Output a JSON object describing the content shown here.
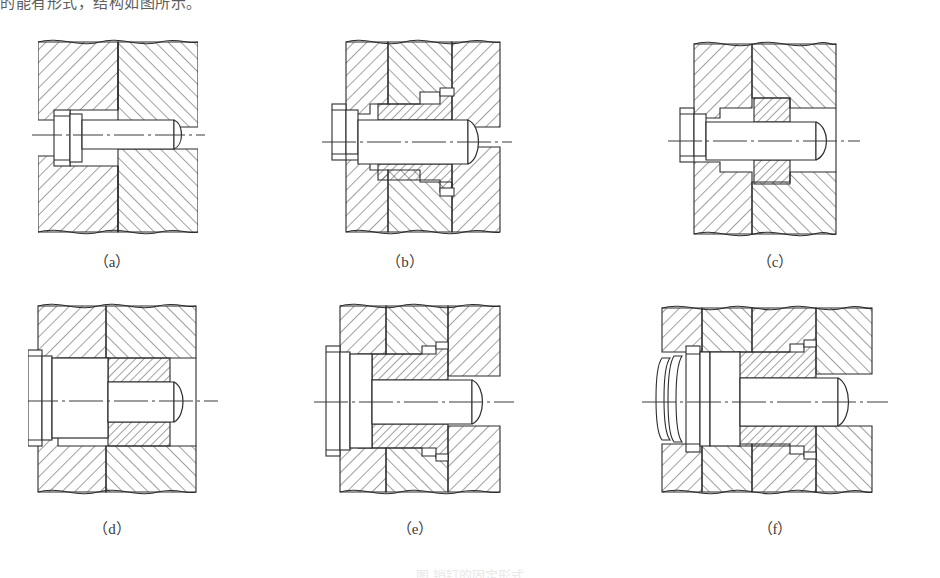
{
  "page": {
    "width": 940,
    "height": 578,
    "background": "#ffffff",
    "ink_color": "#262626",
    "top_cropped_text": "的能有形式，结构如图所示。",
    "bottom_caption": "图 销钉的固定形式"
  },
  "figures": [
    {
      "id": "a",
      "label": "（a）",
      "name": "straight-pin-in-two-plates",
      "description": "Cylindrical pin with flat head seated in a counterbore through two hatched plates",
      "label_x": 112,
      "label_y": 250
    },
    {
      "id": "b",
      "label": "（b）",
      "name": "pin-with-shouldered-bushing",
      "description": "Pin with flat head passing through a shouldered bushing pressed into the lower plate",
      "label_x": 405,
      "label_y": 250
    },
    {
      "id": "c",
      "label": "（c）",
      "name": "pin-with-plain-bushing",
      "description": "Pin with flat head passing through a plain cylindrical bushing in the plate",
      "label_x": 775,
      "label_y": 250
    },
    {
      "id": "d",
      "label": "（d）",
      "name": "stepped-pin-with-large-head",
      "description": "Stepped pin with large cylindrical head and reduced shank entering a bushing",
      "label_x": 112,
      "label_y": 517
    },
    {
      "id": "e",
      "label": "（e）",
      "name": "stepped-pin-with-shouldered-bushing",
      "description": "Stepped pin with large head and shouldered bushing retained in the plate",
      "label_x": 415,
      "label_y": 517
    },
    {
      "id": "f",
      "label": "（f）",
      "name": "stepped-pin-with-spring-and-bushing",
      "description": "Stepped pin with grooved head, intermediate collar and shouldered bushing in three plates",
      "label_x": 775,
      "label_y": 517
    }
  ]
}
